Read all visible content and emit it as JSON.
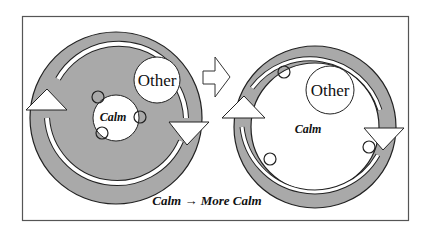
{
  "diagram": {
    "left_panel": {
      "other_label": "Other",
      "calm_label": "Calm"
    },
    "right_panel": {
      "other_label": "Other",
      "calm_label": "Calm"
    },
    "transition_arrow": "right-arrow",
    "caption": "Calm → More Calm"
  },
  "colors": {
    "ring_fill": "#a9a9a9",
    "inner_fill_left": "#a9a9a9",
    "outline": "#222222",
    "frame": "#555555",
    "background": "#ffffff"
  }
}
